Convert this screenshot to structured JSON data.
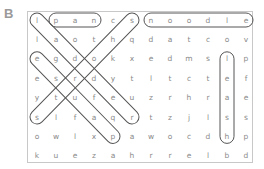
{
  "puzzle": {
    "label": "B",
    "rows": [
      [
        "l",
        "p",
        "a",
        "n",
        "c",
        "s",
        "n",
        "o",
        "o",
        "d",
        "l",
        "e"
      ],
      [
        "l",
        "a",
        "o",
        "t",
        "h",
        "q",
        "d",
        "a",
        "t",
        "c",
        "o",
        "v"
      ],
      [
        "e",
        "g",
        "d",
        "o",
        "k",
        "x",
        "e",
        "d",
        "m",
        "s",
        "l",
        "p"
      ],
      [
        "e",
        "s",
        "r",
        "d",
        "y",
        "t",
        "l",
        "t",
        "c",
        "t",
        "e",
        "f"
      ],
      [
        "y",
        "t",
        "u",
        "f",
        "e",
        "u",
        "z",
        "r",
        "h",
        "r",
        "a",
        "e"
      ],
      [
        "s",
        "l",
        "f",
        "a",
        "q",
        "r",
        "t",
        "z",
        "j",
        "l",
        "s",
        "s"
      ],
      [
        "o",
        "w",
        "l",
        "x",
        "p",
        "a",
        "w",
        "o",
        "c",
        "d",
        "h",
        "p"
      ],
      [
        "k",
        "u",
        "e",
        "z",
        "a",
        "h",
        "r",
        "r",
        "e",
        "l",
        "b",
        "d"
      ]
    ],
    "found_words": [
      {
        "word": "pan",
        "start": [
          0,
          1
        ],
        "end": [
          0,
          3
        ]
      },
      {
        "word": "noodle",
        "start": [
          0,
          6
        ],
        "end": [
          0,
          11
        ]
      },
      {
        "word": "ladder",
        "start": [
          0,
          0
        ],
        "end": [
          5,
          5
        ]
      },
      {
        "word": "shorts",
        "start": [
          0,
          5
        ],
        "end": [
          5,
          0
        ]
      },
      {
        "word": "pause",
        "start": [
          6,
          4
        ],
        "end": [
          2,
          0
        ]
      },
      {
        "word": "leash",
        "start": [
          2,
          10
        ],
        "end": [
          6,
          10
        ]
      }
    ]
  }
}
